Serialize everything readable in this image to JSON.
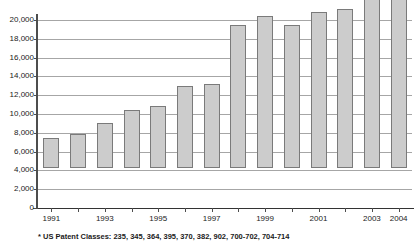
{
  "chart_data": {
    "type": "bar",
    "title": "",
    "subtitle": "",
    "xlabel": "",
    "ylabel": "",
    "ylim": [
      0,
      20000
    ],
    "ytick_step": 2000,
    "grid": true,
    "legend": null,
    "legend_position": "none",
    "categories": [
      "1991",
      "1992",
      "1993",
      "1994",
      "1995",
      "1996",
      "1997",
      "1998",
      "1999",
      "2000",
      "2001",
      "2002",
      "2003",
      "2004"
    ],
    "values": [
      3200,
      3600,
      4800,
      6200,
      6600,
      8700,
      8900,
      15200,
      16200,
      15200,
      16600,
      16900,
      19000,
      21200
    ],
    "ytick_labels": [
      "0",
      "2,000",
      "4,000",
      "6,000",
      "8,000",
      "10,000",
      "12,000",
      "14,000",
      "16,000",
      "18,000",
      "20,000"
    ],
    "xtick_labels_visible": [
      "1991",
      "1993",
      "1995",
      "1997",
      "1999",
      "2001",
      "2003",
      "2004"
    ],
    "annotation": "* US Patent Classes: 235, 345, 364, 395, 370, 382, 902, 700-702, 704-714",
    "colors": {
      "bar_fill": "#cccccc",
      "bar_border": "#7a7a7a",
      "gridline": "#a6a6a6",
      "axis": "#4d4d4d",
      "text": "#1a1a1a",
      "background": "#ffffff"
    }
  }
}
